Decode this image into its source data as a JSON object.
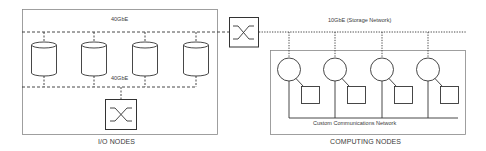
{
  "diagram": {
    "colors": {
      "stroke": "#333333",
      "box": "#888888",
      "text": "#3a3a3a",
      "background": "#ffffff"
    },
    "io_nodes": {
      "caption": "I/O NODES",
      "top_network_label": "40GbE",
      "bottom_network_label": "40GbE",
      "storage_nodes": [
        {
          "name": "storage-node-1",
          "icon": "database-cylinder-icon",
          "cx": 44
        },
        {
          "name": "storage-node-2",
          "icon": "database-cylinder-icon",
          "cx": 94
        },
        {
          "name": "storage-node-3",
          "icon": "database-cylinder-icon",
          "cx": 145
        },
        {
          "name": "storage-node-4",
          "icon": "database-cylinder-icon",
          "cx": 196
        }
      ],
      "internal_switch": {
        "icon": "switch-crossbar-icon"
      }
    },
    "core_switch": {
      "icon": "switch-crossbar-icon"
    },
    "computing_nodes": {
      "caption": "COMPUTING NODES",
      "storage_network_label": "10GbE (Storage Network)",
      "comm_network_label": "Custom Communications Network",
      "nodes": [
        {
          "name": "compute-node-1",
          "cpu_icon": "processor-circle-icon",
          "mem_icon": "memory-square-icon",
          "cx": 289
        },
        {
          "name": "compute-node-2",
          "cpu_icon": "processor-circle-icon",
          "mem_icon": "memory-square-icon",
          "cx": 335
        },
        {
          "name": "compute-node-3",
          "cpu_icon": "processor-circle-icon",
          "mem_icon": "memory-square-icon",
          "cx": 382
        },
        {
          "name": "compute-node-4",
          "cpu_icon": "processor-circle-icon",
          "mem_icon": "memory-square-icon",
          "cx": 428
        }
      ]
    }
  }
}
